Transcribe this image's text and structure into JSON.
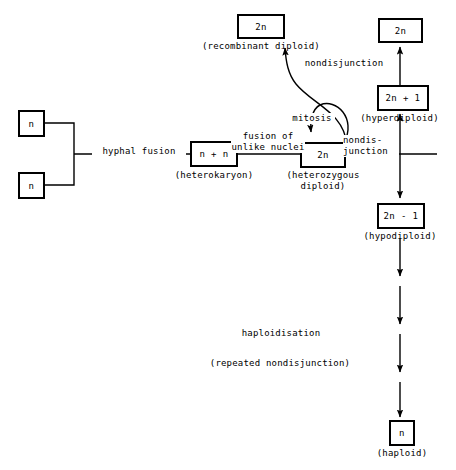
{
  "diagram": {
    "stroke_color": "#000000",
    "background_color": "#ffffff",
    "nodes": [
      {
        "id": "n-left-top",
        "label": "n",
        "caption": ""
      },
      {
        "id": "n-left-bottom",
        "label": "n",
        "caption": ""
      },
      {
        "id": "heterokaryon",
        "label": "n + n",
        "caption": "(heterokaryon)"
      },
      {
        "id": "heterozygous",
        "label": "2n",
        "caption": "(heterozygous\ndiploid)"
      },
      {
        "id": "recombinant",
        "label": "2n",
        "caption": "(recombinant diploid)"
      },
      {
        "id": "diploid-top",
        "label": "2n",
        "caption": ""
      },
      {
        "id": "hyperdiploid",
        "label": "2n + 1",
        "caption": "(hyperdiploid)"
      },
      {
        "id": "hypodiploid",
        "label": "2n - 1",
        "caption": "(hypodiploid)"
      },
      {
        "id": "haploid",
        "label": "n",
        "caption": "(haploid)"
      }
    ],
    "edge_labels": {
      "hyphal_fusion": "hyphal fusion",
      "fusion_unlike_nuclei": "fusion of\nunlike nuclei",
      "mitosis": "mitosis",
      "nondisjunction_top": "nondisjunction",
      "nondisjunction_right": "nondis-\njunction",
      "haploidisation": "haploidisation",
      "repeated_nondisjunction": "(repeated nondisjunction)"
    }
  }
}
